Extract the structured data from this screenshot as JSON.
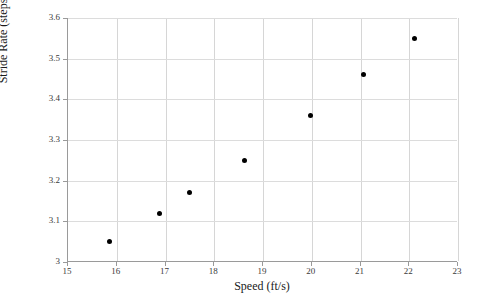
{
  "chart_data": {
    "type": "scatter",
    "title": "",
    "xlabel": "Speed (ft/s)",
    "ylabel": "Stride Rate (steps/s)",
    "xlim": [
      15,
      23
    ],
    "ylim": [
      3,
      3.6
    ],
    "xticks": [
      "15",
      "16",
      "17",
      "18",
      "19",
      "20",
      "21",
      "22",
      "23"
    ],
    "yticks": [
      "3",
      "3.1",
      "3.2",
      "3.3",
      "3.4",
      "3.5",
      "3.6"
    ],
    "xtick_values": [
      15,
      16,
      17,
      18,
      19,
      20,
      21,
      22,
      23
    ],
    "ytick_values": [
      3,
      3.1,
      3.2,
      3.3,
      3.4,
      3.5,
      3.6
    ],
    "grid": true,
    "legend": false,
    "marker_color": "#000000",
    "x": [
      15.86,
      16.88,
      17.5,
      18.62,
      19.97,
      21.06,
      22.11
    ],
    "y": [
      3.05,
      3.12,
      3.17,
      3.25,
      3.36,
      3.46,
      3.55
    ],
    "points": [
      {
        "x": 15.86,
        "y": 3.05
      },
      {
        "x": 16.88,
        "y": 3.12
      },
      {
        "x": 17.5,
        "y": 3.17
      },
      {
        "x": 18.62,
        "y": 3.25
      },
      {
        "x": 19.97,
        "y": 3.36
      },
      {
        "x": 21.06,
        "y": 3.46
      },
      {
        "x": 22.11,
        "y": 3.55
      }
    ]
  }
}
